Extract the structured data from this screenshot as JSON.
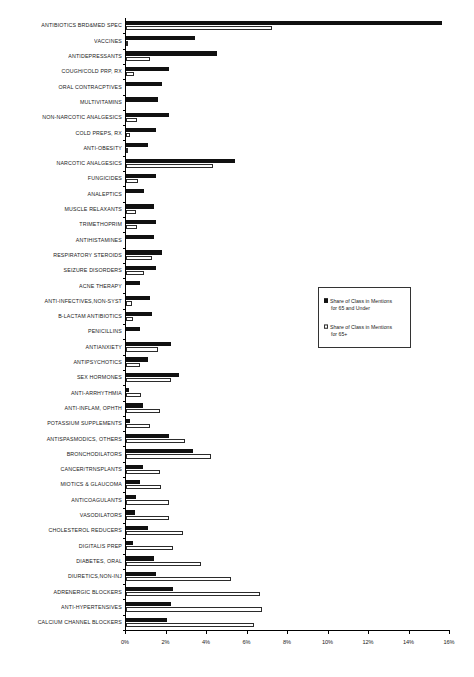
{
  "chart_data": {
    "type": "bar",
    "orientation": "horizontal",
    "title": "",
    "subtitle": "",
    "xlabel": "",
    "ylabel": "",
    "xlim": [
      0,
      16
    ],
    "xticks": [
      "0%",
      "2%",
      "4%",
      "6%",
      "8%",
      "10%",
      "12%",
      "14%",
      "16%"
    ],
    "xtick_values": [
      0,
      2,
      4,
      6,
      8,
      10,
      12,
      14,
      16
    ],
    "grid": false,
    "legend_position": "center-right",
    "categories": [
      "ANTIBIOTICS BRD&MED SPEC",
      "VACCINES",
      "ANTIDEPRESSANTS",
      "COUGH/COLD PRP, RX",
      "ORAL CONTRACPTIVES",
      "MULTIVITAMINS",
      "NON-NARCOTIC ANALGESICS",
      "COLD PREPS, RX",
      "ANTI-OBESITY",
      "NARCOTIC ANALGESICS",
      "FUNGICIDES",
      "ANALEPTICS",
      "MUSCLE RELAXANTS",
      "TRIMETHOPRIM",
      "ANTIHISTAMINES",
      "RESPIRATORY STEROIDS",
      "SEIZURE DISORDERS",
      "ACNE THERAPY",
      "ANTI-INFECTIVES,NON-SYST",
      "B-LACTAM ANTIBIOTICS",
      "PENICILLINS",
      "ANTIANXIETY",
      "ANTIPSYCHOTICS",
      "SEX HORMONES",
      "ANTI-ARRHYTHMIA",
      "ANTI-INFLAM, OPHTH",
      "POTASSIUM SUPPLEMENTS",
      "ANTISPASMODICS, OTHERS",
      "BRONCHODILATORS",
      "CANCER/TRNSPLANTS",
      "MIOTICS & GLAUCOMA",
      "ANTICOAGULANTS",
      "VASODILATORS",
      "CHOLESTEROL REDUCERS",
      "DIGITALIS PREP",
      "DIABETES, ORAL",
      "DIURETICS,NON-INJ",
      "ADRENERGIC BLOCKERS",
      "ANTI-HYPERTENSIVES",
      "CALCIUM CHANNEL BLOCKERS"
    ],
    "series": [
      {
        "name": "Share of Class in Mentions for 65 and Under",
        "style": "filled",
        "color": "#111111",
        "values": [
          15.6,
          3.4,
          4.5,
          2.1,
          1.8,
          1.6,
          2.1,
          1.5,
          1.1,
          5.4,
          1.5,
          0.9,
          1.4,
          1.5,
          1.4,
          1.8,
          1.5,
          0.7,
          1.2,
          1.3,
          0.7,
          2.2,
          1.1,
          2.6,
          0.15,
          0.85,
          0.2,
          2.1,
          3.3,
          0.85,
          0.7,
          0.5,
          0.45,
          1.1,
          0.35,
          1.4,
          1.5,
          2.3,
          2.2,
          2.0
        ]
      },
      {
        "name": "Share of Class in Mentions for 65+",
        "style": "hollow",
        "color": "#ffffff",
        "values": [
          7.2,
          0.1,
          1.2,
          0.4,
          0.0,
          0.0,
          0.55,
          0.2,
          0.1,
          4.3,
          0.6,
          0.0,
          0.5,
          0.55,
          0.0,
          1.3,
          0.9,
          0.0,
          0.3,
          0.35,
          0.0,
          1.6,
          0.7,
          2.2,
          0.75,
          1.7,
          1.2,
          2.9,
          4.2,
          1.7,
          1.75,
          2.1,
          2.1,
          2.8,
          2.3,
          3.7,
          5.2,
          6.6,
          6.7,
          6.3
        ]
      }
    ]
  },
  "legend": {
    "entries": [
      {
        "line1": "Share of Class in Mentions",
        "line2": "for 65 and Under",
        "style": "filled"
      },
      {
        "line1": "Share of Class in Mentions",
        "line2": "for 65+",
        "style": "hollow"
      }
    ]
  }
}
